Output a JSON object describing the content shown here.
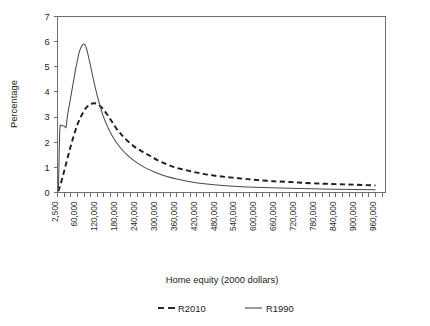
{
  "chart_data": {
    "type": "line",
    "title": "",
    "xlabel": "Home equity (2000 dollars)",
    "ylabel": "Percentage",
    "xlim": [
      0,
      990000
    ],
    "ylim": [
      0,
      7
    ],
    "grid": false,
    "legend_position": "bottom",
    "y_ticks": [
      "0",
      "1",
      "2",
      "3",
      "4",
      "5",
      "6",
      "7"
    ],
    "x_tick_labels": [
      "2,500",
      "60,000",
      "120,000",
      "180,000",
      "240,000",
      "300,000",
      "360,000",
      "420,000",
      "480,000",
      "540,000",
      "600,000",
      "660,000",
      "720,000",
      "780,000",
      "840,000",
      "900,000",
      "960,000"
    ],
    "x_tick_values": [
      2500,
      60000,
      120000,
      180000,
      240000,
      300000,
      360000,
      420000,
      480000,
      540000,
      600000,
      660000,
      720000,
      780000,
      840000,
      900000,
      960000
    ],
    "minor_tick_interval": 20000,
    "series": [
      {
        "name": "R2010",
        "style": "dashed",
        "color": "#1d1d1d",
        "x": [
          2500,
          10000,
          20000,
          30000,
          40000,
          50000,
          60000,
          70000,
          80000,
          90000,
          100000,
          110000,
          120000,
          130000,
          140000,
          150000,
          160000,
          170000,
          180000,
          190000,
          200000,
          220000,
          240000,
          260000,
          280000,
          300000,
          330000,
          360000,
          400000,
          440000,
          480000,
          520000,
          560000,
          600000,
          650000,
          700000,
          750000,
          800000,
          850000,
          900000,
          960000
        ],
        "values": [
          0.05,
          0.35,
          0.85,
          1.35,
          1.85,
          2.3,
          2.7,
          3.0,
          3.25,
          3.42,
          3.52,
          3.55,
          3.52,
          3.42,
          3.28,
          3.1,
          2.9,
          2.7,
          2.5,
          2.35,
          2.2,
          1.95,
          1.75,
          1.6,
          1.45,
          1.3,
          1.12,
          0.98,
          0.85,
          0.74,
          0.66,
          0.6,
          0.55,
          0.5,
          0.45,
          0.42,
          0.38,
          0.35,
          0.33,
          0.31,
          0.28
        ]
      },
      {
        "name": "R1990",
        "style": "solid",
        "color": "#4a4a4a",
        "x": [
          2500,
          3500,
          5000,
          6500,
          8000,
          10000,
          14000,
          18000,
          22000,
          26000,
          30000,
          36000,
          42000,
          48000,
          54000,
          60000,
          66000,
          72000,
          78000,
          84000,
          90000,
          96000,
          102000,
          110000,
          118000,
          126000,
          134000,
          142000,
          150000,
          160000,
          170000,
          180000,
          195000,
          210000,
          230000,
          250000,
          270000,
          300000,
          330000,
          360000,
          400000,
          450000,
          500000,
          560000,
          620000,
          700000,
          800000,
          900000,
          960000
        ],
        "values": [
          0.05,
          0.55,
          1.5,
          2.35,
          2.65,
          2.68,
          2.66,
          2.65,
          2.62,
          2.6,
          3.05,
          3.5,
          3.95,
          4.4,
          4.85,
          5.25,
          5.6,
          5.8,
          5.9,
          5.85,
          5.6,
          5.25,
          4.9,
          4.4,
          3.95,
          3.55,
          3.2,
          2.9,
          2.65,
          2.38,
          2.15,
          1.95,
          1.7,
          1.5,
          1.28,
          1.1,
          0.95,
          0.78,
          0.64,
          0.54,
          0.43,
          0.34,
          0.28,
          0.23,
          0.2,
          0.17,
          0.14,
          0.12,
          0.11
        ]
      }
    ],
    "legend": [
      {
        "label": "R2010",
        "style": "dashed"
      },
      {
        "label": "R1990",
        "style": "solid"
      }
    ]
  },
  "axes": {
    "x_title": "Home equity (2000 dollars)",
    "y_title": "Percentage"
  },
  "colors": {
    "frame": "#6e6e6e",
    "solid_series": "#4a4a4a",
    "dashed_series": "#1d1d1d",
    "background": "#ffffff"
  }
}
